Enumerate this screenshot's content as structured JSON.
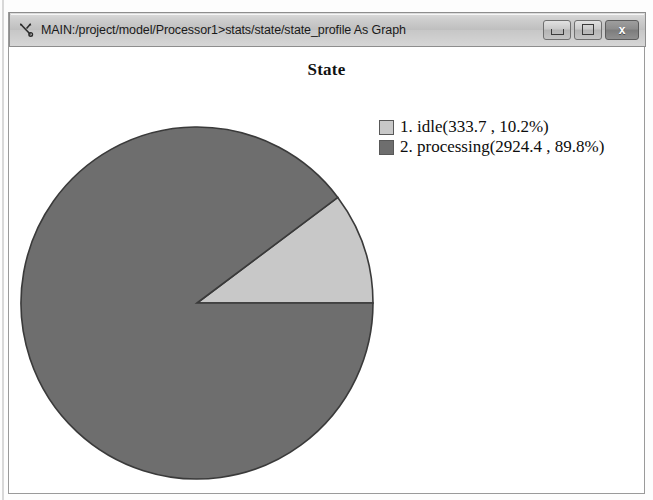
{
  "window": {
    "title": "MAIN:/project/model/Processor1>stats/state/state_profile As Graph",
    "app_icon_name": "crossed-tools-icon",
    "buttons": {
      "minimize_label": "",
      "maximize_label": "",
      "close_label": "x"
    }
  },
  "chart_data": {
    "type": "pie",
    "title": "State",
    "xlabel": "",
    "ylabel": "",
    "legend_position": "right",
    "grid": false,
    "start_angle_deg": 0,
    "direction": "counterclockwise",
    "categories": [
      "idle",
      "processing"
    ],
    "values": [
      333.7,
      2924.4
    ],
    "percents": [
      10.2,
      89.8
    ],
    "colors": [
      "#c8c8c8",
      "#6e6e6e"
    ],
    "outline_color": "#3a3a3a",
    "slices": [
      {
        "index": 1,
        "name": "idle",
        "value": 333.7,
        "percent": 10.2,
        "color": "#c8c8c8",
        "legend_label": "1. idle(333.7 ,  10.2%)"
      },
      {
        "index": 2,
        "name": "processing",
        "value": 2924.4,
        "percent": 89.8,
        "color": "#6e6e6e",
        "legend_label": "2. processing(2924.4 ,  89.8%)"
      }
    ]
  }
}
